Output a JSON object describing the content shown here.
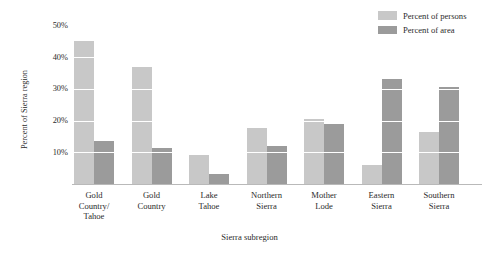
{
  "chart_data": {
    "type": "bar",
    "title": "",
    "xlabel": "Sierra subregion",
    "ylabel": "Percent of Sierra region",
    "ylim": [
      0,
      52
    ],
    "ytick_values": [
      10,
      20,
      30,
      40,
      50
    ],
    "ytick_labels": [
      "10%",
      "20%",
      "30%",
      "40%",
      "50%"
    ],
    "grid": true,
    "grid_color": "#ffffff",
    "legend_position": "top-right",
    "categories": [
      "Gold\nCountry/\nTahoe",
      "Gold\nCountry",
      "Lake\nTahoe",
      "Northern\nSierra",
      "Mother\nLode",
      "Eastern\nSierra",
      "Southern\nSierra"
    ],
    "series": [
      {
        "name": "Percent of persons",
        "color": "#c8c8c8",
        "values": [
          45.0,
          37.0,
          9.0,
          17.5,
          20.5,
          6.0,
          16.5
        ]
      },
      {
        "name": "Percent of area",
        "color": "#9b9b9b",
        "values": [
          13.5,
          11.5,
          3.0,
          12.0,
          19.0,
          33.0,
          30.5
        ]
      }
    ]
  },
  "legend": {
    "items": [
      {
        "label": "Percent of persons",
        "color": "#c8c8c8"
      },
      {
        "label": "Percent of area",
        "color": "#9b9b9b"
      }
    ]
  },
  "axes": {
    "y_title": "Percent of Sierra region",
    "x_title": "Sierra subregion",
    "y_ticks": [
      "50%",
      "40%",
      "30%",
      "20%",
      "10%"
    ],
    "x_ticks": [
      {
        "line1": "Gold",
        "line2": "Country/",
        "line3": "Tahoe"
      },
      {
        "line1": "Gold",
        "line2": "Country",
        "line3": ""
      },
      {
        "line1": "Lake",
        "line2": "Tahoe",
        "line3": ""
      },
      {
        "line1": "Northern",
        "line2": "Sierra",
        "line3": ""
      },
      {
        "line1": "Mother",
        "line2": "Lode",
        "line3": ""
      },
      {
        "line1": "Eastern",
        "line2": "Sierra",
        "line3": ""
      },
      {
        "line1": "Southern",
        "line2": "Sierra",
        "line3": ""
      }
    ]
  }
}
